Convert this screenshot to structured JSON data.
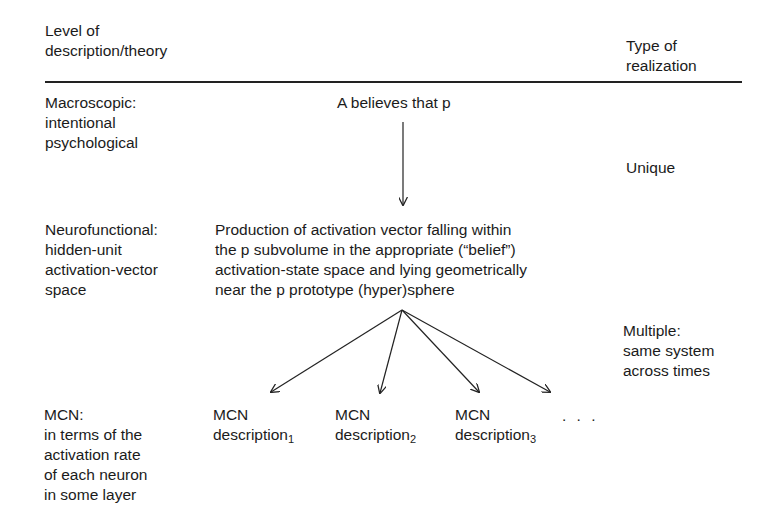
{
  "header": {
    "level_column": "Level of\ndescription/theory",
    "realization_column": "Type of\nrealization"
  },
  "rows": [
    {
      "level": "Macroscopic:\nintentional\npsychological",
      "content": "A believes that p"
    },
    {
      "level": "Neurofunctional:\nhidden-unit\nactivation-vector\nspace",
      "content": "Production of activation vector falling within\nthe p subvolume in the appropriate (“belief”)\nactivation-state space and lying geometrically\nnear the p prototype (hyper)sphere"
    },
    {
      "level": "MCN:\nin terms of the\nactivation rate\nof each neuron\nin some layer",
      "descriptions": [
        {
          "label": "MCN\ndescription",
          "sub": "1"
        },
        {
          "label": "MCN\ndescription",
          "sub": "2"
        },
        {
          "label": "MCN\ndescription",
          "sub": "3"
        }
      ],
      "ellipsis": ". . ."
    }
  ],
  "realizations": [
    {
      "label": "Unique"
    },
    {
      "label": "Multiple:\nsame system\nacross times"
    }
  ],
  "arrows": {
    "vertical": {
      "from": [
        403,
        122
      ],
      "to": [
        403,
        205
      ]
    },
    "fan_origin": [
      402,
      310
    ],
    "fan_targets": [
      [
        271,
        392
      ],
      [
        380,
        393
      ],
      [
        479,
        392
      ],
      [
        550,
        392
      ]
    ]
  }
}
